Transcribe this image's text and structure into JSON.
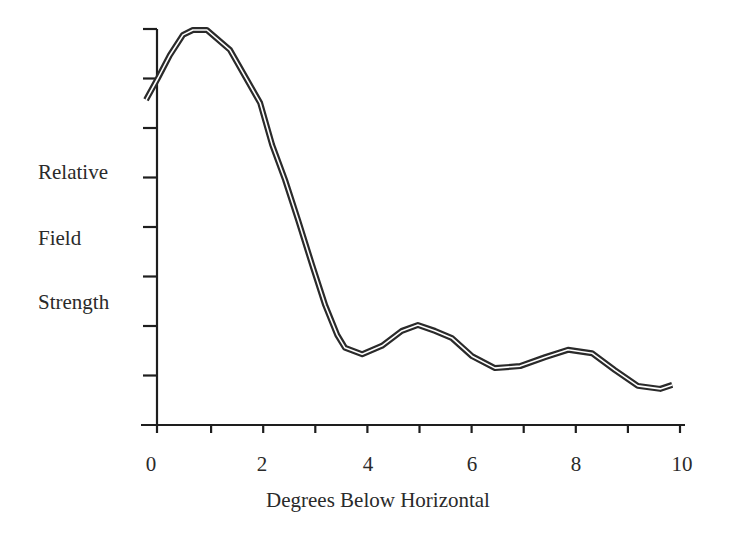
{
  "chart_data": {
    "type": "line",
    "title": "",
    "xlabel": "Degrees Below Horizontal",
    "ylabel": "Relative Field Strength",
    "ylabel_lines": [
      "Relative",
      "Field",
      "Strength"
    ],
    "xlim": [
      0,
      10
    ],
    "ylim": [
      0,
      8
    ],
    "x_ticks": [
      0,
      1,
      2,
      3,
      4,
      5,
      6,
      7,
      8,
      9,
      10
    ],
    "x_tick_labels": [
      "0",
      "2",
      "4",
      "6",
      "8",
      "10"
    ],
    "x_tick_label_values": [
      0,
      2,
      4,
      6,
      8,
      10
    ],
    "y_ticks": [
      1,
      2,
      3,
      4,
      5,
      6,
      7,
      8
    ],
    "y_tick_labels": [],
    "grid": false,
    "legend": null,
    "line_style": "double stroke (dark outline with white center)",
    "series": [
      {
        "name": "Relative Field Strength",
        "x": [
          -0.25,
          -0.02,
          0.21,
          0.46,
          0.65,
          0.92,
          1.36,
          1.94,
          2.17,
          2.42,
          2.67,
          2.94,
          3.19,
          3.42,
          3.57,
          3.9,
          4.28,
          4.66,
          4.97,
          5.3,
          5.62,
          6.01,
          6.45,
          6.93,
          7.41,
          7.85,
          8.31,
          8.75,
          9.19,
          9.62,
          9.85
        ],
        "y": [
          6.57,
          7.01,
          7.47,
          7.88,
          7.98,
          7.98,
          7.58,
          6.51,
          5.66,
          4.95,
          4.14,
          3.23,
          2.42,
          1.82,
          1.56,
          1.43,
          1.6,
          1.9,
          2.02,
          1.9,
          1.76,
          1.39,
          1.15,
          1.19,
          1.37,
          1.52,
          1.45,
          1.11,
          0.79,
          0.73,
          0.81
        ]
      }
    ]
  },
  "labels": {
    "ylabel_line1": "Relative",
    "ylabel_line2": "Field",
    "ylabel_line3": "Strength",
    "xlabel": "Degrees Below Horizontal",
    "xtick_0": "0",
    "xtick_2": "2",
    "xtick_4": "4",
    "xtick_6": "6",
    "xtick_8": "8",
    "xtick_10": "10"
  },
  "colors": {
    "axis": "#1e1e1e",
    "line_outer": "#2a2a2a",
    "line_inner": "#ffffff",
    "text": "#2a2a2a"
  }
}
